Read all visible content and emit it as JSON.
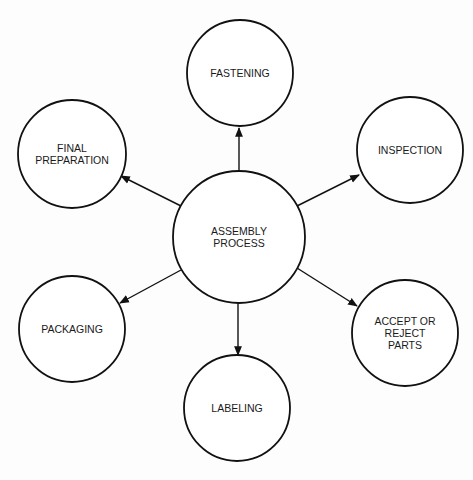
{
  "diagram": {
    "type": "hub-and-spoke",
    "center": {
      "id": "assembly",
      "label": "ASSEMBLY\nPROCESS"
    },
    "nodes": [
      {
        "id": "fastening",
        "label": "FASTENING"
      },
      {
        "id": "inspection",
        "label": "INSPECTION"
      },
      {
        "id": "accept-reject",
        "label": "ACCEPT OR\nREJECT\nPARTS"
      },
      {
        "id": "labeling",
        "label": "LABELING"
      },
      {
        "id": "packaging",
        "label": "PACKAGING"
      },
      {
        "id": "final-preparation",
        "label": "FINAL\nPREPARATION"
      }
    ],
    "edges": [
      {
        "from": "assembly",
        "to": "fastening"
      },
      {
        "from": "assembly",
        "to": "inspection"
      },
      {
        "from": "assembly",
        "to": "accept-reject"
      },
      {
        "from": "assembly",
        "to": "labeling"
      },
      {
        "from": "assembly",
        "to": "packaging"
      },
      {
        "from": "assembly",
        "to": "final-preparation"
      }
    ],
    "colors": {
      "stroke": "#111111",
      "fill": "#ffffff",
      "text": "#1a1a1a"
    }
  }
}
